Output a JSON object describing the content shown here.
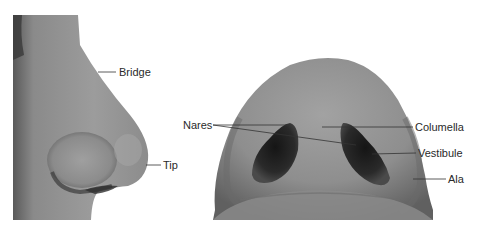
{
  "figure": {
    "panels": [
      {
        "id": "lateral-view",
        "description": "Side profile of the external nose",
        "labels": [
          {
            "text": "Bridge",
            "x": 118,
            "y": 66
          },
          {
            "text": "Tip",
            "x": 163,
            "y": 159
          }
        ]
      },
      {
        "id": "inferior-view",
        "description": "View of the nose from below",
        "labels": [
          {
            "text": "Nares",
            "x": 183,
            "y": 119
          },
          {
            "text": "Columella",
            "x": 415,
            "y": 121
          },
          {
            "text": "Vestibule",
            "x": 418,
            "y": 147
          },
          {
            "text": "Ala",
            "x": 448,
            "y": 174
          }
        ]
      }
    ]
  },
  "colors": {
    "background": "#ffffff",
    "skin_light": "#9a9a9a",
    "skin_mid": "#7e7e7e",
    "skin_dark": "#505050",
    "nostril": "#1c1c1c",
    "leader_line": "#333333",
    "label_text": "#2a2a2a"
  }
}
